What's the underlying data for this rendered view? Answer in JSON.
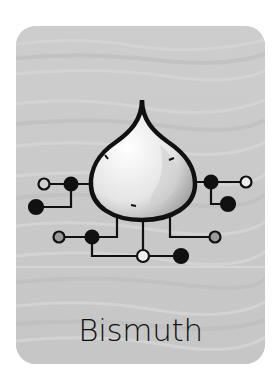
{
  "card": {
    "title": "Bismuth",
    "icon": "drop-circuit-icon",
    "background_color": "#c9c9c9",
    "stroke_color": "#111111",
    "node_fill_gray": "#9a9a9a",
    "node_fill_white": "#eeeeee"
  }
}
